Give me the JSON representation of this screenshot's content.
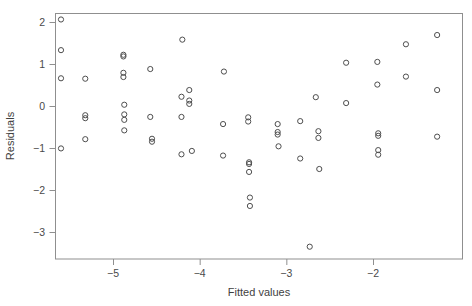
{
  "chart_data": {
    "type": "scatter",
    "title": "",
    "xlabel": "Fitted values",
    "ylabel": "Residuals",
    "xlim": [
      -5.72,
      -1.0
    ],
    "ylim": [
      -3.55,
      2.25
    ],
    "grid": false,
    "legend": null,
    "marker": "open-circle",
    "xticks": [
      -5,
      -4,
      -3,
      -2
    ],
    "xticklabels": [
      "−5",
      "−4",
      "−3",
      "−2"
    ],
    "yticks": [
      2,
      1,
      0,
      -1,
      -2,
      -3
    ],
    "yticklabels": [
      "2",
      "1",
      "0",
      "−1",
      "−2",
      "−3"
    ],
    "n_points": 71,
    "points": [
      {
        "x": -5.6,
        "y": 2.06
      },
      {
        "x": -5.6,
        "y": 1.33
      },
      {
        "x": -5.6,
        "y": 0.66
      },
      {
        "x": -5.6,
        "y": -1.01
      },
      {
        "x": -5.32,
        "y": 0.65
      },
      {
        "x": -5.32,
        "y": -0.22
      },
      {
        "x": -5.32,
        "y": -0.29
      },
      {
        "x": -5.32,
        "y": -0.79
      },
      {
        "x": -4.88,
        "y": 1.22
      },
      {
        "x": -4.88,
        "y": 1.18
      },
      {
        "x": -4.88,
        "y": 0.79
      },
      {
        "x": -4.88,
        "y": 0.69
      },
      {
        "x": -4.87,
        "y": 0.03
      },
      {
        "x": -4.87,
        "y": -0.2
      },
      {
        "x": -4.87,
        "y": -0.33
      },
      {
        "x": -4.87,
        "y": -0.58
      },
      {
        "x": -4.57,
        "y": 0.88
      },
      {
        "x": -4.57,
        "y": -0.26
      },
      {
        "x": -4.55,
        "y": -0.78
      },
      {
        "x": -4.55,
        "y": -0.85
      },
      {
        "x": -4.2,
        "y": 1.58
      },
      {
        "x": -4.21,
        "y": 0.22
      },
      {
        "x": -4.21,
        "y": -0.26
      },
      {
        "x": -4.21,
        "y": -1.15
      },
      {
        "x": -4.12,
        "y": 0.38
      },
      {
        "x": -4.12,
        "y": 0.13
      },
      {
        "x": -4.12,
        "y": 0.05
      },
      {
        "x": -4.09,
        "y": -1.07
      },
      {
        "x": -3.72,
        "y": 0.82
      },
      {
        "x": -3.73,
        "y": -0.43
      },
      {
        "x": -3.73,
        "y": -1.18
      },
      {
        "x": -3.44,
        "y": -0.27
      },
      {
        "x": -3.44,
        "y": -0.37
      },
      {
        "x": -3.43,
        "y": -1.34
      },
      {
        "x": -3.43,
        "y": -1.38
      },
      {
        "x": -3.43,
        "y": -1.57
      },
      {
        "x": -3.42,
        "y": -2.18
      },
      {
        "x": -3.42,
        "y": -2.38
      },
      {
        "x": -3.1,
        "y": -0.43
      },
      {
        "x": -3.1,
        "y": -0.62
      },
      {
        "x": -3.1,
        "y": -0.68
      },
      {
        "x": -3.09,
        "y": -0.96
      },
      {
        "x": -2.84,
        "y": -0.36
      },
      {
        "x": -2.84,
        "y": -1.25
      },
      {
        "x": -2.73,
        "y": -3.35
      },
      {
        "x": -2.66,
        "y": 0.21
      },
      {
        "x": -2.63,
        "y": -0.6
      },
      {
        "x": -2.63,
        "y": -0.76
      },
      {
        "x": -2.62,
        "y": -1.5
      },
      {
        "x": -2.31,
        "y": 1.03
      },
      {
        "x": -2.31,
        "y": 0.07
      },
      {
        "x": -1.95,
        "y": 1.05
      },
      {
        "x": -1.95,
        "y": 0.51
      },
      {
        "x": -1.94,
        "y": -0.65
      },
      {
        "x": -1.94,
        "y": -0.71
      },
      {
        "x": -1.94,
        "y": -1.05
      },
      {
        "x": -1.94,
        "y": -1.16
      },
      {
        "x": -1.62,
        "y": 1.47
      },
      {
        "x": -1.62,
        "y": 0.7
      },
      {
        "x": -1.26,
        "y": 1.69
      },
      {
        "x": -1.26,
        "y": 0.38
      },
      {
        "x": -1.26,
        "y": -0.73
      }
    ]
  },
  "axes": {
    "ylabel": "Residuals",
    "xlabel": "Fitted values"
  }
}
